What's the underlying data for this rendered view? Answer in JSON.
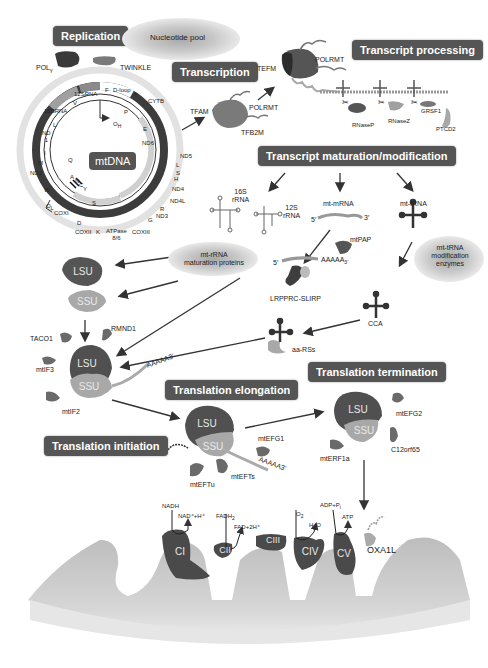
{
  "headers": {
    "replication": "Replication",
    "transcription": "Transcription",
    "transcript_processing": "Transcript processing",
    "transcript_maturation": "Transcript maturation/modification",
    "translation_initiation": "Translation initiation",
    "translation_elongation": "Translation elongation",
    "translation_termination": "Translation termination"
  },
  "replication": {
    "nucleotide_pool": "Nucleotide pool",
    "pol_gamma": "POL",
    "pol_gamma_sub": "γ",
    "twinkle": "TWINKLE"
  },
  "mtdna": {
    "center_label": "mtDNA",
    "genes": {
      "rrna12s": "12SRNA",
      "rrna16s": "16SRNA",
      "f": "F",
      "dloop": "D-loop",
      "t": "T",
      "cytb": "CYTB",
      "v": "V",
      "l1": "L",
      "nd1": "ND",
      "nd1_num": "1",
      "i": "I",
      "m": "M",
      "nd2": "ND2",
      "w": "W",
      "ol": "O",
      "ol_sub": "L",
      "cox1": "COXI",
      "d": "D",
      "cox2": "COXII",
      "k": "K",
      "atpase": "ATPase",
      "atpase_num": "8/6",
      "cox3": "COXIII",
      "g": "G",
      "nd3": "ND3",
      "r": "R",
      "nd4l": "ND4L",
      "nd4": "ND4",
      "h": "H",
      "s2": "S",
      "l2": "L",
      "nd5": "ND5",
      "nd6": "ND6",
      "e": "E",
      "p": "P",
      "oh": "O",
      "oh_sub": "H",
      "q": "Q",
      "a": "A",
      "n": "N",
      "c": "C",
      "y": "Y",
      "s1": "S"
    }
  },
  "transcription": {
    "tfam": "TFAM",
    "polrmt": "POLRMT",
    "tfb2m": "TFB2M",
    "tefm": "TEFM",
    "polrmt2": "POLRMT"
  },
  "processing": {
    "rnase_p": "RNaseP",
    "rnase_z": "RNaseZ",
    "grsf1": "GRSF1",
    "ptcd2": "PTCD2"
  },
  "maturation": {
    "rrna16s": "16S",
    "rrna16s_b": "rRNA",
    "rrna12s": "12S",
    "rrna12s_b": "rRNA",
    "mt_mrna": "mt-mRNA",
    "five_prime": "5′",
    "three_prime": "3′",
    "mtpap": "mtPAP",
    "polya_5": "5′",
    "polya": "AAAAA",
    "polya_3": "3′",
    "lrpprc": "LRPPRC-SLIRP",
    "mt_trna": "mt-tRNA",
    "trna_mod": [
      "mt-tRNA",
      "modification",
      "enzymes"
    ],
    "rrna_mat": [
      "mt-rRNA",
      "maturation proteins"
    ],
    "cca": "CCA",
    "aars": "aa-RSs"
  },
  "initiation": {
    "lsu": "LSU",
    "ssu": "SSU",
    "taco1": "TACO1",
    "rmnd1": "RMND1",
    "mtif3": "mtIF3",
    "mtif2": "mtIF2",
    "polya": "AAAAA3′"
  },
  "elongation": {
    "lsu": "LSU",
    "ssu": "SSU",
    "mtefg1": "mtEFG1",
    "mtefts": "mtEFTs",
    "mteftu": "mtEFTu",
    "polya": "AAAAA3′"
  },
  "termination": {
    "lsu": "LSU",
    "ssu": "SSU",
    "mtefg2": "mtEFG2",
    "c12orf65": "C12orf65",
    "mterf1a": "mtERF1a"
  },
  "oxphos": {
    "ci": "CI",
    "cii": "CII",
    "ciii": "CIII",
    "civ": "CIV",
    "cv": "CV",
    "oxa1l": "OXA1L",
    "nadh": "NADH",
    "nad": "NAD⁺+H⁺",
    "fadh2": "FADH",
    "fadh2_sub": "2",
    "fad": "FAD+2H⁺",
    "o2": "O",
    "o2_sub": "2",
    "h2o_h": "H",
    "h2o_sub": "2",
    "h2o_o": "O",
    "adp": "ADP+P",
    "adp_sub": "i",
    "atp": "ATP"
  },
  "colors": {
    "header_bg": "#555555",
    "dark_protein": "#4a4a4a",
    "mid_protein": "#6e6e6e",
    "light_protein": "#a8a8a8",
    "membrane": "#c4c4c4"
  }
}
